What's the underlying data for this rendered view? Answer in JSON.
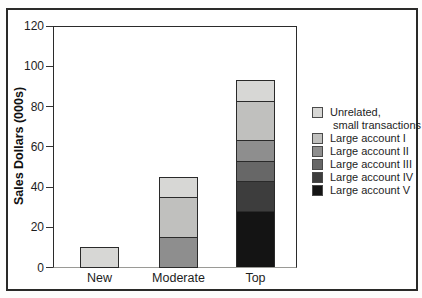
{
  "chart_data": {
    "type": "bar",
    "stacked": true,
    "title": "",
    "xlabel": "",
    "ylabel": "Sales Dollars (000s)",
    "ylim": [
      0,
      120
    ],
    "yticks": [
      0,
      20,
      40,
      60,
      80,
      100,
      120
    ],
    "grid": false,
    "legend_position": "right",
    "categories": [
      "New",
      "Moderate",
      "Top"
    ],
    "series": [
      {
        "name": "Large account V",
        "color": "#141414",
        "values": [
          0,
          0,
          28
        ]
      },
      {
        "name": "Large account IV",
        "color": "#3d3d3d",
        "values": [
          0,
          0,
          15
        ]
      },
      {
        "name": "Large account III",
        "color": "#676767",
        "values": [
          0,
          0,
          10
        ]
      },
      {
        "name": "Large account II",
        "color": "#8e8e8e",
        "values": [
          0,
          15,
          10
        ]
      },
      {
        "name": "Large account I",
        "color": "#c0c0be",
        "values": [
          0,
          20,
          20
        ]
      },
      {
        "name": "Unrelated, small transactions",
        "color": "#d7d7d5",
        "values": [
          10,
          10,
          10
        ]
      }
    ],
    "bar_totals": {
      "New": 10,
      "Moderate": 45,
      "Top": 93
    },
    "legend": [
      {
        "lines": [
          "Unrelated,",
          "small transactions"
        ],
        "color": "#d7d7d5"
      },
      {
        "lines": [
          "Large account I"
        ],
        "color": "#c0c0be"
      },
      {
        "lines": [
          "Large account II"
        ],
        "color": "#8e8e8e"
      },
      {
        "lines": [
          "Large account III"
        ],
        "color": "#676767"
      },
      {
        "lines": [
          "Large account IV"
        ],
        "color": "#3d3d3d"
      },
      {
        "lines": [
          "Large account V"
        ],
        "color": "#141414"
      }
    ]
  }
}
